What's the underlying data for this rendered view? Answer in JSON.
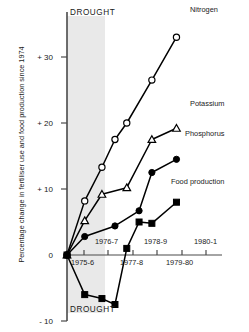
{
  "chart_data": {
    "type": "line",
    "title": "",
    "xlabel": "",
    "ylabel": "Percentage change in fertiliser use and food production since 1974",
    "ylim": [
      -10,
      35
    ],
    "yticks": [
      -10,
      0,
      10,
      20,
      30
    ],
    "ytick_labels": [
      "- 10",
      "0",
      "+ 10",
      "+ 20",
      "+ 30"
    ],
    "grid": false,
    "legend": "inline-right-of-series",
    "categories": [
      "1975-6",
      "1976-7",
      "1977-8",
      "1978-9",
      "1979-80",
      "1980-1"
    ],
    "xtick_labels": [
      "1975-6",
      "1976-7",
      "1977-8",
      "1978-9",
      "1979-80",
      "1980-1"
    ],
    "annotations": [
      {
        "text": "DROUGHT",
        "position": "top-band"
      },
      {
        "text": "DROUGHT",
        "position": "bottom-band"
      }
    ],
    "shaded_band": {
      "label": "DROUGHT",
      "from": "1975-6",
      "to": "1976-7",
      "color": "#e8e8e8"
    },
    "series": [
      {
        "name": "Nitrogen",
        "marker": "open-circle",
        "color": "#000000",
        "x": [
          0,
          0.72,
          1.42,
          1.95,
          2.43,
          3.45,
          4.45
        ],
        "values": [
          0,
          8.2,
          13.3,
          17.5,
          20.0,
          26.5,
          33.0
        ]
      },
      {
        "name": "Potassium",
        "marker": "open-triangle",
        "color": "#000000",
        "x": [
          0,
          0.72,
          1.42,
          2.43,
          3.45,
          4.45
        ],
        "values": [
          0,
          5.2,
          9.2,
          10.2,
          17.5,
          19.2
        ]
      },
      {
        "name": "Phosphorus",
        "marker": "filled-circle",
        "color": "#000000",
        "x": [
          0,
          0.72,
          1.95,
          2.93,
          3.45,
          4.45
        ],
        "values": [
          0,
          2.8,
          4.4,
          6.7,
          12.5,
          14.5
        ]
      },
      {
        "name": "Food production",
        "marker": "filled-square",
        "color": "#000000",
        "x": [
          0,
          0.72,
          1.42,
          1.95,
          2.43,
          2.93,
          3.45,
          4.45
        ],
        "values": [
          0,
          -6.0,
          -6.6,
          -7.5,
          1.0,
          5.0,
          4.8,
          8.0
        ]
      }
    ]
  },
  "labels": {
    "nitrogen": "Nitrogen",
    "potassium": "Potassium",
    "phosphorus": "Phosphorus",
    "food_production": "Food production",
    "drought_top": "DROUGHT",
    "drought_bottom": "DROUGHT",
    "y_axis_title": "Percentage change in fertiliser use and food production since 1974",
    "y_30": "+ 30",
    "y_20": "+ 20",
    "y_10": "+ 10",
    "y_0": "0",
    "y_neg10": "- 10",
    "x_1975_6": "1975-6",
    "x_1976_7": "1976-7",
    "x_1977_8": "1977-8",
    "x_1978_9": "1978-9",
    "x_1979_80": "1979-80",
    "x_1980_1": "1980-1"
  }
}
